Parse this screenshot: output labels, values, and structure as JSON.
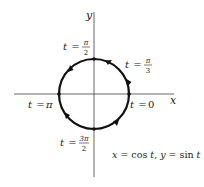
{
  "diagram": {
    "type": "parametric-unit-circle",
    "axes": {
      "x_label": "x",
      "y_label": "y"
    },
    "equation": "x = cos t, y = sin t",
    "equation_parts": {
      "x_var": "x",
      "eq1": " = cos ",
      "t1": "t",
      "sep": ", ",
      "y_var": "y",
      "eq2": " = sin ",
      "t2": "t"
    },
    "points": [
      {
        "name": "t-0",
        "t_label": "t",
        "eq": " = ",
        "value": "0"
      },
      {
        "name": "t-pi-over-3",
        "t_label": "t",
        "eq": " = ",
        "num": "π",
        "den": "3"
      },
      {
        "name": "t-pi-over-2",
        "t_label": "t",
        "eq": " = ",
        "num": "π",
        "den": "2"
      },
      {
        "name": "t-pi",
        "t_label": "t",
        "eq": " = ",
        "value": "π"
      },
      {
        "name": "t-3pi-over-2",
        "t_label": "t",
        "eq": " = ",
        "num": "3π",
        "den": "2"
      }
    ],
    "direction": "counterclockwise",
    "colors": {
      "curve": "#111111",
      "axes": "#555555",
      "text": "#222222"
    }
  }
}
